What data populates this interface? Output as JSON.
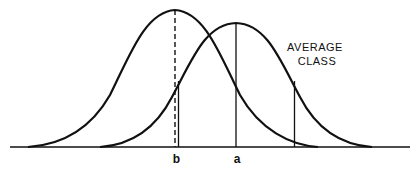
{
  "diagram": {
    "type": "overlapping-normal-distributions",
    "colors": {
      "ink": "#111111",
      "background": "#ffffff"
    },
    "curve_label": {
      "line1": "AVERAGE",
      "line2": "CLASS"
    },
    "axis_labels": {
      "b": "b",
      "a": "a"
    },
    "curves": [
      {
        "name": "left-distribution",
        "mean_label": "b",
        "peak_line": "dashed"
      },
      {
        "name": "right-distribution-average-class",
        "mean_label": "a",
        "peak_line": "solid"
      }
    ],
    "vertical_markers": [
      {
        "at": "b",
        "style": "dashed",
        "from": "left-peak"
      },
      {
        "at": "b",
        "style": "solid",
        "from": "right-curve"
      },
      {
        "at": "a",
        "style": "solid",
        "from": "right-peak"
      },
      {
        "at": "right-of-a",
        "style": "solid",
        "from": "right-curve"
      }
    ]
  }
}
